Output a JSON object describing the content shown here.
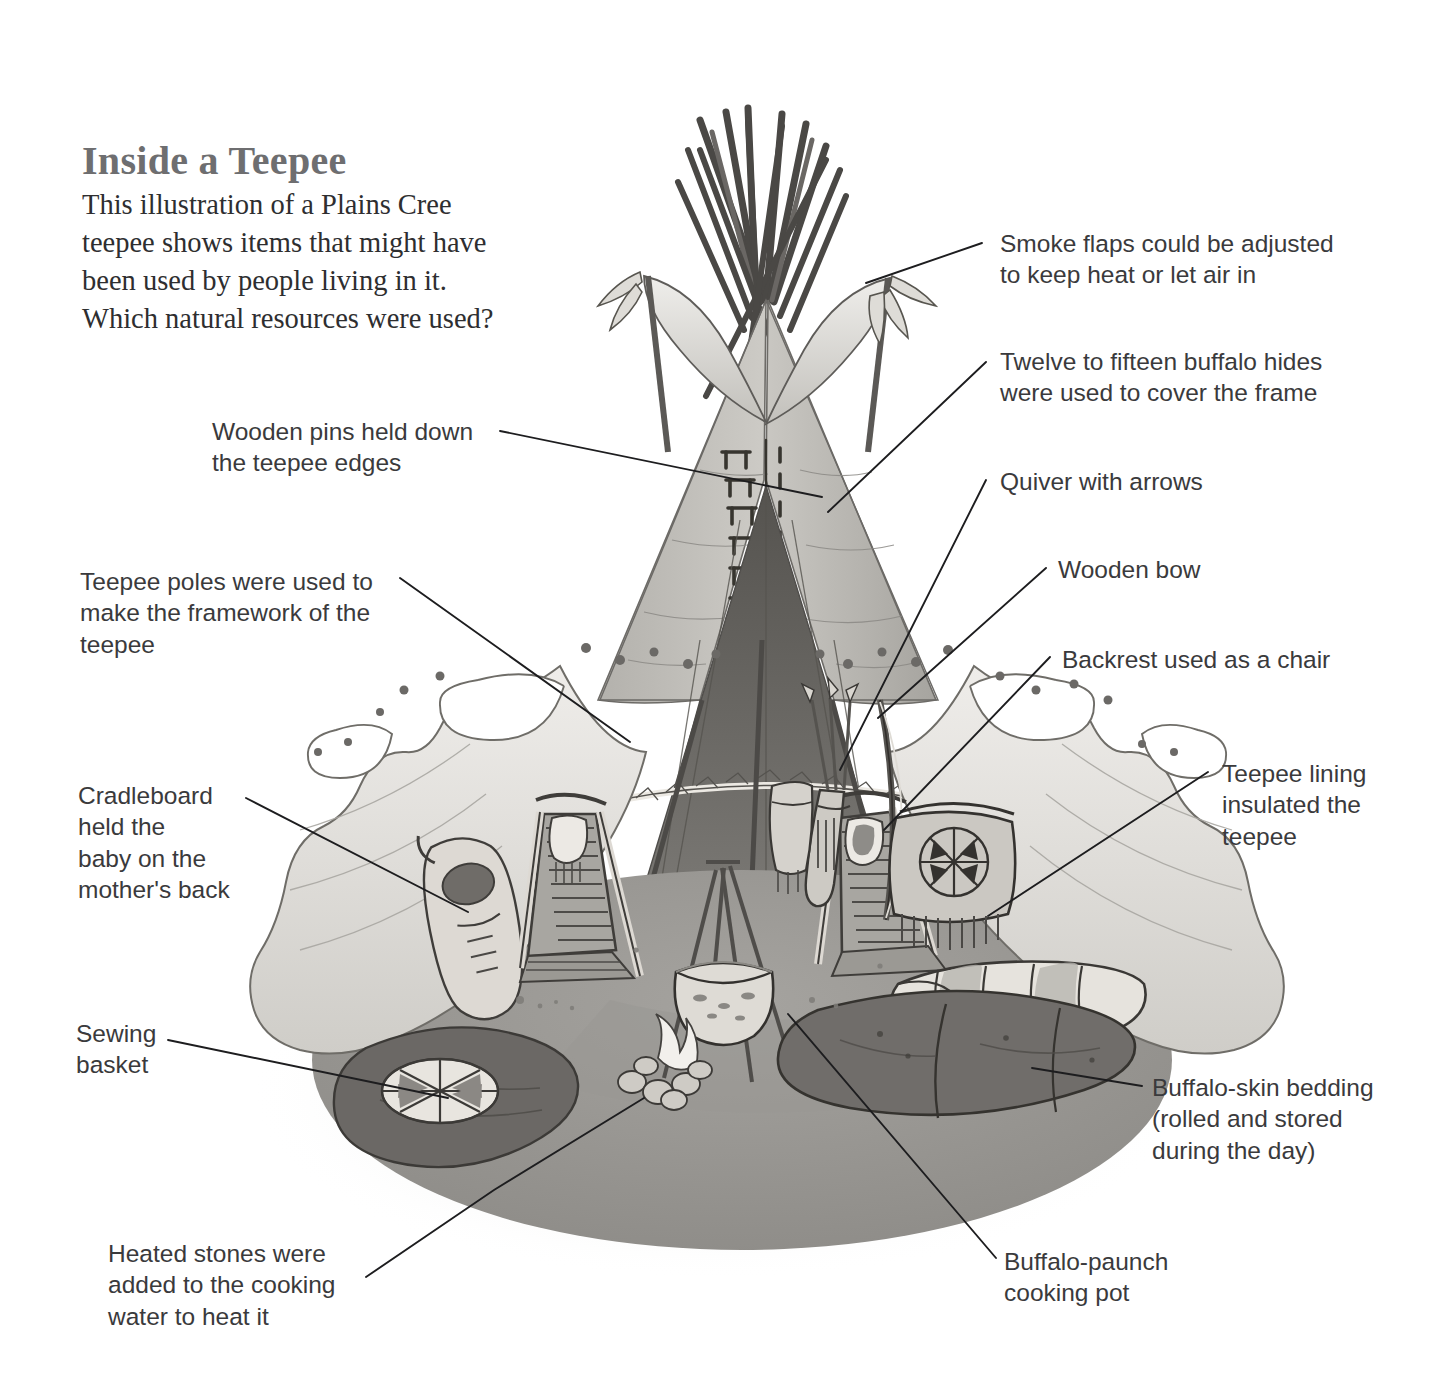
{
  "page": {
    "title": "Inside a Teepee",
    "intro_lines": [
      "This illustration of a Plains Cree",
      "teepee shows items that might have",
      "been used by people living in it.",
      "Which natural resources were used?"
    ],
    "background_color": "#ffffff",
    "title_color": "#6e6e70",
    "text_color": "#3a3a3c"
  },
  "labels": {
    "smoke_flaps": "Smoke flaps could be adjusted\nto keep heat or let air in",
    "buffalo_hides": "Twelve to fifteen buffalo hides\nwere used to cover the frame",
    "quiver": "Quiver with arrows",
    "bow": "Wooden bow",
    "backrest": "Backrest used as a chair",
    "lining": "Teepee lining\ninsulated the\nteepee",
    "bedding": "Buffalo-skin bedding\n(rolled and stored\nduring the day)",
    "cooking_pot": "Buffalo-paunch\ncooking pot",
    "heated_stones": "Heated stones were\nadded to the cooking\nwater to heat it",
    "sewing_basket": "Sewing\nbasket",
    "cradleboard": "Cradleboard\nheld the\nbaby on the\nmother's back",
    "teepee_poles": "Teepee poles were used to\nmake the framework of the\nteepee",
    "wooden_pins": "Wooden pins held down\nthe teepee edges"
  },
  "illustration": {
    "subject": "plains-cree-teepee-cutaway",
    "palette": {
      "cover_light": "#d8d6d2",
      "cover_mid": "#b9b7b3",
      "cover_shadow": "#8e8c88",
      "lining_pale": "#e7e5e1",
      "interior_dark": "#6f6d6a",
      "ground": "#9b9996",
      "hide_dark": "#6a6764",
      "ink": "#3c3a38",
      "flame": "#f4f2ee"
    },
    "elements": [
      "pole-bundle-apex",
      "smoke-flaps",
      "feather-tufts",
      "lacing-pins",
      "dotted-band",
      "cutaway-lining",
      "cradleboard",
      "backrest-left",
      "backrest-right",
      "quiver-with-arrows",
      "wooden-bow",
      "parfleche-bag",
      "cooking-pot-tripod",
      "fire-with-stones",
      "sewing-basket",
      "rolled-bedding",
      "buffalo-hide-bedding"
    ]
  }
}
